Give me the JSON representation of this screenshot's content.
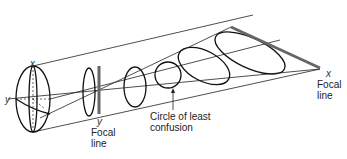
{
  "diagram": {
    "labels": {
      "lens_x": "x",
      "lens_y": "y",
      "y_focal_axis": "y",
      "y_focal_line_1": "Focal",
      "y_focal_line_2": "line",
      "circle_1": "Circle of least",
      "circle_2": "confusion",
      "x_focal_axis": "x",
      "x_focal_line_1": "Focal",
      "x_focal_line_2": "line"
    },
    "colors": {
      "stroke": "#111111",
      "focal_line": "#666666",
      "text": "#222222"
    }
  }
}
